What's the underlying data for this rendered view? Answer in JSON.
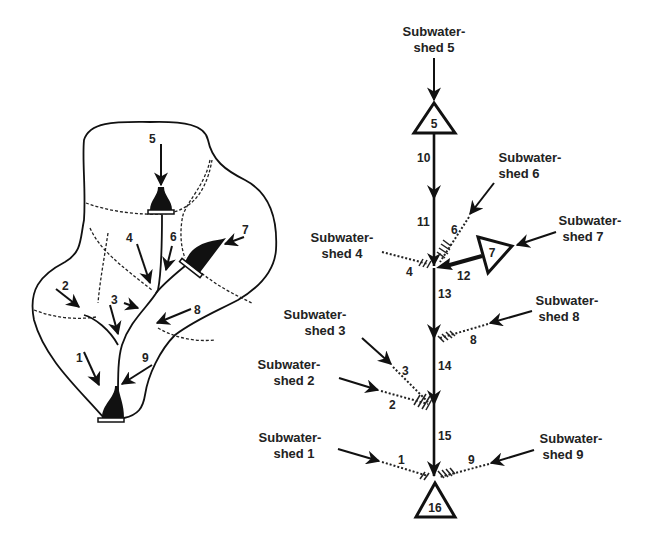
{
  "watershed_map": {
    "subwatershed_numbers": [
      "1",
      "2",
      "3",
      "4",
      "5",
      "6",
      "7",
      "8",
      "9"
    ]
  },
  "network": {
    "subwatersheds": [
      {
        "id": "1",
        "line1": "Subwater-",
        "line2": "shed 1"
      },
      {
        "id": "2",
        "line1": "Subwater-",
        "line2": "shed 2"
      },
      {
        "id": "3",
        "line1": "Subwater-",
        "line2": "shed 3"
      },
      {
        "id": "4",
        "line1": "Subwater-",
        "line2": "shed 4"
      },
      {
        "id": "5",
        "line1": "Subwater-",
        "line2": "shed 5"
      },
      {
        "id": "6",
        "line1": "Subwater-",
        "line2": "shed 6"
      },
      {
        "id": "7",
        "line1": "Subwater-",
        "line2": "shed 7"
      },
      {
        "id": "8",
        "line1": "Subwater-",
        "line2": "shed 8"
      },
      {
        "id": "9",
        "line1": "Subwater-",
        "line2": "shed 9"
      }
    ],
    "runoff_labels": [
      "1",
      "2",
      "3",
      "4",
      "6",
      "8",
      "9"
    ],
    "reaches": [
      "10",
      "11",
      "12",
      "13",
      "14",
      "15"
    ],
    "reservoirs": [
      "5",
      "7",
      "16"
    ]
  }
}
